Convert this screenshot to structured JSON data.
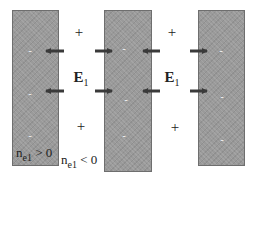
{
  "diagram": {
    "slabs": [
      {
        "id": "left",
        "x": 12,
        "y": 10,
        "w": 47,
        "h": 156
      },
      {
        "id": "middle",
        "x": 104,
        "y": 10,
        "w": 48,
        "h": 162
      },
      {
        "id": "right",
        "x": 198,
        "y": 10,
        "w": 47,
        "h": 156
      }
    ],
    "slab_color": "#9a9a9a",
    "charges": {
      "symbol": "-",
      "left": [
        {
          "x": 30,
          "y": 50
        },
        {
          "x": 30,
          "y": 93
        },
        {
          "x": 30,
          "y": 135
        }
      ],
      "middle": [
        {
          "x": 124,
          "y": 48
        },
        {
          "x": 126,
          "y": 99
        },
        {
          "x": 124,
          "y": 135
        }
      ],
      "right": [
        {
          "x": 221,
          "y": 50
        },
        {
          "x": 222,
          "y": 96
        },
        {
          "x": 222,
          "y": 139
        }
      ]
    },
    "plus_signs": {
      "symbol": "+",
      "items": [
        {
          "x": 79,
          "y": 32
        },
        {
          "x": 81,
          "y": 126
        },
        {
          "x": 172,
          "y": 32
        },
        {
          "x": 175,
          "y": 127
        }
      ]
    },
    "field_labels": [
      {
        "id": "e-left",
        "base": "E",
        "sub": "1",
        "x": 81,
        "y": 78
      },
      {
        "id": "e-right",
        "base": "E",
        "sub": "1",
        "x": 172,
        "y": 78
      }
    ],
    "arrows": [
      {
        "x1": 64,
        "y": 51,
        "x2": 44,
        "dir": "left"
      },
      {
        "x1": 95,
        "y": 51,
        "x2": 114,
        "dir": "right"
      },
      {
        "x1": 64,
        "y": 91,
        "x2": 44,
        "dir": "left"
      },
      {
        "x1": 95,
        "y": 91,
        "x2": 114,
        "dir": "right"
      },
      {
        "x1": 160,
        "y": 51,
        "x2": 141,
        "dir": "left"
      },
      {
        "x1": 190,
        "y": 51,
        "x2": 209,
        "dir": "right"
      },
      {
        "x1": 160,
        "y": 91,
        "x2": 141,
        "dir": "left"
      },
      {
        "x1": 190,
        "y": 91,
        "x2": 209,
        "dir": "right"
      }
    ],
    "arrow_color": "#3a3a3a",
    "annotations": {
      "slab_label": {
        "base": "n",
        "sub": "e1",
        "rel": " > 0"
      },
      "gap_label": {
        "base": "n",
        "sub": "e1",
        "rel": " < 0"
      }
    }
  }
}
